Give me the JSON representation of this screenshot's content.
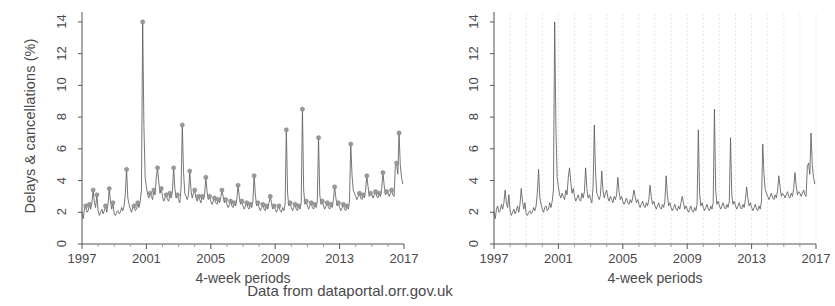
{
  "caption": "Data from dataportal.orr.gov.uk",
  "panels": [
    {
      "id": "left",
      "ylabel": "Delays & cancellations (%)",
      "xlabel": "4-week periods",
      "markers": true,
      "gridlines": false
    },
    {
      "id": "right",
      "ylabel": "",
      "xlabel": "4-week periods",
      "markers": false,
      "gridlines": true
    }
  ],
  "chart_data": {
    "type": "line",
    "title": "",
    "subtitle": "",
    "annotation": "Data from dataportal.orr.gov.uk",
    "xlabel": "4-week periods",
    "ylabel": "Delays & cancellations (%)",
    "xlim": [
      1997,
      2017
    ],
    "ylim": [
      0,
      14.5
    ],
    "yticks": [
      0,
      2,
      4,
      6,
      8,
      10,
      12,
      14
    ],
    "xticks": [
      1997,
      2001,
      2005,
      2009,
      2013,
      2017
    ],
    "grid": "vertical-annual-dotted-right-panel-only",
    "legend": "none",
    "marker_style": "gray filled circles on local peaks (left panel only)",
    "line_color": "#555555",
    "marker_color": "#8a8a8a",
    "series": [
      {
        "name": "Delays & cancellations (%)",
        "x": [
          1997.0,
          1997.077,
          1997.154,
          1997.231,
          1997.308,
          1997.385,
          1997.462,
          1997.538,
          1997.615,
          1997.692,
          1997.769,
          1997.846,
          1997.923,
          1998.0,
          1998.077,
          1998.154,
          1998.231,
          1998.308,
          1998.385,
          1998.462,
          1998.538,
          1998.615,
          1998.692,
          1998.769,
          1998.846,
          1998.923,
          1999.0,
          1999.077,
          1999.154,
          1999.231,
          1999.308,
          1999.385,
          1999.462,
          1999.538,
          1999.615,
          1999.692,
          1999.769,
          1999.846,
          1999.923,
          2000.0,
          2000.077,
          2000.154,
          2000.231,
          2000.308,
          2000.385,
          2000.462,
          2000.538,
          2000.615,
          2000.692,
          2000.769,
          2000.846,
          2000.923,
          2001.0,
          2001.077,
          2001.154,
          2001.231,
          2001.308,
          2001.385,
          2001.462,
          2001.538,
          2001.615,
          2001.692,
          2001.769,
          2001.846,
          2001.923,
          2002.0,
          2002.077,
          2002.154,
          2002.231,
          2002.308,
          2002.385,
          2002.462,
          2002.538,
          2002.615,
          2002.692,
          2002.769,
          2002.846,
          2002.923,
          2003.0,
          2003.077,
          2003.154,
          2003.231,
          2003.308,
          2003.385,
          2003.462,
          2003.538,
          2003.615,
          2003.692,
          2003.769,
          2003.846,
          2003.923,
          2004.0,
          2004.077,
          2004.154,
          2004.231,
          2004.308,
          2004.385,
          2004.462,
          2004.538,
          2004.615,
          2004.692,
          2004.769,
          2004.846,
          2004.923,
          2005.0,
          2005.077,
          2005.154,
          2005.231,
          2005.308,
          2005.385,
          2005.462,
          2005.538,
          2005.615,
          2005.692,
          2005.769,
          2005.846,
          2005.923,
          2006.0,
          2006.077,
          2006.154,
          2006.231,
          2006.308,
          2006.385,
          2006.462,
          2006.538,
          2006.615,
          2006.692,
          2006.769,
          2006.846,
          2006.923,
          2007.0,
          2007.077,
          2007.154,
          2007.231,
          2007.308,
          2007.385,
          2007.462,
          2007.538,
          2007.615,
          2007.692,
          2007.769,
          2007.846,
          2007.923,
          2008.0,
          2008.077,
          2008.154,
          2008.231,
          2008.308,
          2008.385,
          2008.462,
          2008.538,
          2008.615,
          2008.692,
          2008.769,
          2008.846,
          2008.923,
          2009.0,
          2009.077,
          2009.154,
          2009.231,
          2009.308,
          2009.385,
          2009.462,
          2009.538,
          2009.615,
          2009.692,
          2009.769,
          2009.846,
          2009.923,
          2010.0,
          2010.077,
          2010.154,
          2010.231,
          2010.308,
          2010.385,
          2010.462,
          2010.538,
          2010.615,
          2010.692,
          2010.769,
          2010.846,
          2010.923,
          2011.0,
          2011.077,
          2011.154,
          2011.231,
          2011.308,
          2011.385,
          2011.462,
          2011.538,
          2011.615,
          2011.692,
          2011.769,
          2011.846,
          2011.923,
          2012.0,
          2012.077,
          2012.154,
          2012.231,
          2012.308,
          2012.385,
          2012.462,
          2012.538,
          2012.615,
          2012.692,
          2012.769,
          2012.846,
          2012.923,
          2013.0,
          2013.077,
          2013.154,
          2013.231,
          2013.308,
          2013.385,
          2013.462,
          2013.538,
          2013.615,
          2013.692,
          2013.769,
          2013.846,
          2013.923,
          2014.0,
          2014.077,
          2014.154,
          2014.231,
          2014.308,
          2014.385,
          2014.462,
          2014.538,
          2014.615,
          2014.692,
          2014.769,
          2014.846,
          2014.923,
          2015.0,
          2015.077,
          2015.154,
          2015.231,
          2015.308,
          2015.385,
          2015.462,
          2015.538,
          2015.615,
          2015.692,
          2015.769,
          2015.846,
          2015.923,
          2016.0,
          2016.077,
          2016.154,
          2016.231,
          2016.308,
          2016.385,
          2016.462,
          2016.538,
          2016.615,
          2016.692,
          2016.769,
          2016.846,
          2016.923
        ],
        "values": [
          2.0,
          1.6,
          2.2,
          2.4,
          2.0,
          2.1,
          2.5,
          2.2,
          2.6,
          3.4,
          2.6,
          2.3,
          3.1,
          2.1,
          1.8,
          2.0,
          2.2,
          1.9,
          2.1,
          2.4,
          2.0,
          2.5,
          3.5,
          2.7,
          2.2,
          2.6,
          1.9,
          1.8,
          2.0,
          2.1,
          1.9,
          2.0,
          2.3,
          2.1,
          2.4,
          3.2,
          4.7,
          2.9,
          2.5,
          2.2,
          2.0,
          2.3,
          2.4,
          2.1,
          2.2,
          2.6,
          2.3,
          2.7,
          3.4,
          14.0,
          7.4,
          4.2,
          3.6,
          3.1,
          2.9,
          3.2,
          3.0,
          2.8,
          3.4,
          3.1,
          4.2,
          4.8,
          3.9,
          3.2,
          3.5,
          3.0,
          2.7,
          2.9,
          3.1,
          2.8,
          2.7,
          3.2,
          2.9,
          3.3,
          4.8,
          3.5,
          2.9,
          3.1,
          2.8,
          2.6,
          3.6,
          7.5,
          4.5,
          3.2,
          3.0,
          2.8,
          3.1,
          4.6,
          3.4,
          2.9,
          3.2,
          3.4,
          2.9,
          2.7,
          3.0,
          2.8,
          2.6,
          3.0,
          2.8,
          3.1,
          4.2,
          3.3,
          2.8,
          3.0,
          2.7,
          2.5,
          2.7,
          2.9,
          2.6,
          2.5,
          2.8,
          2.6,
          2.9,
          3.4,
          3.0,
          2.6,
          2.8,
          2.5,
          2.3,
          2.5,
          2.7,
          2.4,
          2.3,
          2.6,
          2.4,
          2.8,
          3.7,
          3.0,
          2.5,
          2.7,
          2.4,
          2.2,
          2.4,
          2.6,
          2.3,
          2.2,
          2.5,
          2.3,
          2.7,
          4.3,
          3.1,
          2.4,
          2.6,
          2.3,
          2.1,
          2.3,
          2.5,
          2.2,
          2.1,
          2.4,
          2.2,
          2.6,
          3.0,
          2.6,
          2.2,
          2.4,
          2.2,
          2.0,
          2.2,
          2.4,
          2.1,
          2.0,
          2.3,
          2.1,
          2.5,
          7.2,
          3.2,
          2.4,
          2.6,
          2.3,
          2.1,
          2.3,
          2.5,
          2.2,
          2.1,
          2.4,
          2.2,
          2.6,
          8.5,
          3.4,
          2.5,
          2.7,
          2.4,
          2.2,
          2.4,
          2.6,
          2.3,
          2.2,
          2.5,
          2.3,
          2.7,
          6.7,
          3.1,
          2.5,
          2.7,
          2.4,
          2.2,
          2.4,
          2.6,
          2.3,
          2.2,
          2.5,
          2.3,
          2.8,
          3.6,
          2.9,
          2.4,
          2.6,
          2.3,
          2.1,
          2.3,
          2.5,
          2.2,
          2.1,
          2.4,
          2.2,
          2.7,
          6.3,
          4.4,
          3.4,
          3.2,
          3.0,
          2.8,
          3.0,
          3.2,
          2.9,
          2.8,
          3.1,
          2.9,
          3.4,
          4.3,
          3.6,
          3.0,
          3.2,
          3.1,
          2.9,
          3.1,
          3.3,
          3.0,
          2.9,
          3.2,
          3.0,
          3.5,
          4.5,
          3.7,
          3.1,
          3.3,
          3.2,
          3.0,
          3.2,
          3.4,
          3.1,
          3.0,
          4.9,
          5.1,
          4.4,
          7.0,
          5.0,
          4.2,
          3.8
        ]
      }
    ]
  }
}
